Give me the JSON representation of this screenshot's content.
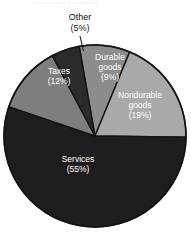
{
  "figure": {
    "background_color": "#ffffff",
    "title_remnant": "-- consumer spending --",
    "width": 191,
    "height": 236
  },
  "chart_data": {
    "type": "pie",
    "title": "",
    "subtitle": "",
    "xlabel": "",
    "ylabel": "",
    "legend_position": "none",
    "grid": false,
    "center": [
      95,
      136
    ],
    "radius": 91,
    "start_angle_deg": -10,
    "direction": "clockwise",
    "total_pct": 100,
    "categories": [
      "Durable goods",
      "Nondurable goods",
      "Services",
      "Taxes",
      "Other"
    ],
    "values": [
      9,
      19,
      55,
      12,
      5
    ],
    "slices": [
      {
        "name": "Durable goods",
        "label": "Durable",
        "label_line2": "goods",
        "value": 9,
        "pct_text": "(9%)",
        "color": "#8c8c8c",
        "stroke": "#141414",
        "label_color": "#ffffff",
        "label_placement": "inside"
      },
      {
        "name": "Nondurable goods",
        "label": "Nondurable",
        "label_line2": "goods",
        "value": 19,
        "pct_text": "(19%)",
        "color": "#a9a9a9",
        "stroke": "#141414",
        "label_color": "#ffffff",
        "label_placement": "inside"
      },
      {
        "name": "Services",
        "label": "Services",
        "label_line2": "",
        "value": 55,
        "pct_text": "(55%)",
        "color": "#1e1e1e",
        "stroke": "#141414",
        "label_color": "#ffffff",
        "label_placement": "inside"
      },
      {
        "name": "Taxes",
        "label": "Taxes",
        "label_line2": "",
        "value": 12,
        "pct_text": "(12%)",
        "color": "#7e7e7e",
        "stroke": "#141414",
        "label_color": "#ffffff",
        "label_placement": "inside"
      },
      {
        "name": "Other",
        "label": "Other",
        "label_line2": "",
        "value": 5,
        "pct_text": "(5%)",
        "color": "#2b2b2b",
        "stroke": "#141414",
        "label_color": "#111111",
        "label_placement": "outside-callout"
      }
    ]
  }
}
